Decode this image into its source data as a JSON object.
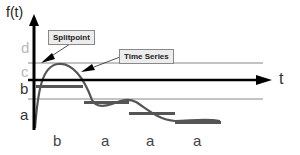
{
  "diagram": {
    "axes": {
      "y_label": "f(t)",
      "x_label": "t"
    },
    "levels": [
      {
        "label": "d",
        "shade": "light"
      },
      {
        "label": "c",
        "shade": "light"
      },
      {
        "label": "b",
        "shade": "dark"
      },
      {
        "label": "a",
        "shade": "dark"
      }
    ],
    "segment_labels": [
      "b",
      "a",
      "a",
      "a"
    ],
    "callouts": {
      "splitpoint": "Splitpoint",
      "time_series": "Time Series"
    },
    "colors": {
      "axis": "#000000",
      "threshold_line": "#888888",
      "curve": "#555555",
      "segment_bar": "#555555",
      "callout_bg": "#ececec"
    }
  }
}
